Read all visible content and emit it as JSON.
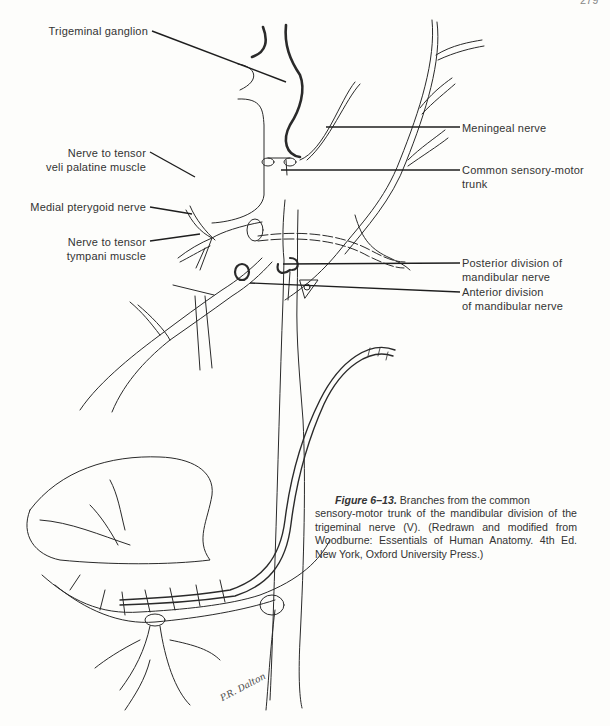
{
  "figure": {
    "page_number": "279",
    "labels_left": [
      {
        "id": "trigeminal-ganglion",
        "lines": [
          "Trigeminal ganglion"
        ]
      },
      {
        "id": "nerve-tensor-veli",
        "lines": [
          "Nerve to tensor",
          "veli palatine muscle"
        ]
      },
      {
        "id": "medial-pterygoid",
        "lines": [
          "Medial pterygoid nerve"
        ]
      },
      {
        "id": "nerve-tensor-tympani",
        "lines": [
          "Nerve to tensor",
          "tympani muscle"
        ]
      }
    ],
    "labels_right": [
      {
        "id": "meningeal-nerve",
        "lines": [
          "Meningeal nerve"
        ]
      },
      {
        "id": "common-sensory-motor-trunk",
        "lines": [
          "Common sensory-motor",
          "trunk"
        ]
      },
      {
        "id": "posterior-division",
        "lines": [
          "Posterior division of",
          "mandibular nerve"
        ]
      },
      {
        "id": "anterior-division",
        "lines": [
          "Anterior division",
          "of mandibular nerve"
        ]
      }
    ],
    "caption": {
      "figure_label": "Figure 6–13.",
      "text_first": "Branches from the common",
      "text_rest": "sensory-motor trunk of the mandibular division of the trigeminal nerve (V). (Redrawn and modified from Woodburne: Essentials of Human Anatomy. 4th Ed. New York, Oxford University Press.)"
    },
    "signature": "P.R. Dalton",
    "colors": {
      "ink": "#2a2a2a",
      "paper": "#fdfdfb"
    }
  }
}
